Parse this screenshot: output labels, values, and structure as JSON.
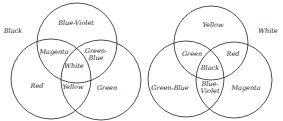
{
  "diagrams": [
    {
      "name": "additive-color-mixing",
      "background_label": "Black",
      "circles": [
        "Blue-Violet",
        "Red",
        "Green"
      ],
      "regions": {
        "top": "Blue-Violet",
        "left": "Red",
        "right": "Green",
        "top_left": "Magenta",
        "top_right_line1": "Green-",
        "top_right_line2": "Blue",
        "bottom": "Yellow",
        "center": "White"
      }
    },
    {
      "name": "subtractive-color-mixing",
      "background_label": "White",
      "circles": [
        "Yellow",
        "Green-Blue",
        "Magenta"
      ],
      "regions": {
        "top": "Yellow",
        "left": "Green-Blue",
        "right": "Magenta",
        "top_left": "Green",
        "top_right": "Red",
        "bottom_line1": "Blue-",
        "bottom_line2": "Violet",
        "center": "Black"
      }
    }
  ],
  "colors": {
    "stroke": "#222222",
    "text": "#222222",
    "background": "#ffffff"
  }
}
